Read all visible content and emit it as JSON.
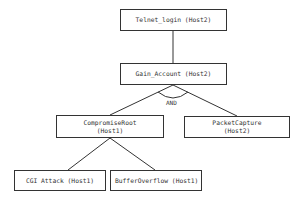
{
  "diagram": {
    "type": "attack-tree",
    "nodes": [
      {
        "id": "telnet",
        "line1": "Telnet_login (Host2)",
        "line2": ""
      },
      {
        "id": "gain",
        "line1": "Gain_Account (Host2)",
        "line2": ""
      },
      {
        "id": "compromise",
        "line1": "CompromiseRoot",
        "line2": "(Host1)"
      },
      {
        "id": "packet",
        "line1": "PacketCapture",
        "line2": "(Host2)"
      },
      {
        "id": "cgi",
        "line1": "CGI Attack (Host1)",
        "line2": ""
      },
      {
        "id": "buffer",
        "line1": "BufferOverflow (Host1)",
        "line2": ""
      }
    ],
    "edges": [
      {
        "from": "telnet",
        "to": "gain"
      },
      {
        "from": "gain",
        "to": "compromise"
      },
      {
        "from": "gain",
        "to": "packet"
      },
      {
        "from": "compromise",
        "to": "cgi"
      },
      {
        "from": "compromise",
        "to": "buffer"
      }
    ],
    "and_label": "AND"
  }
}
